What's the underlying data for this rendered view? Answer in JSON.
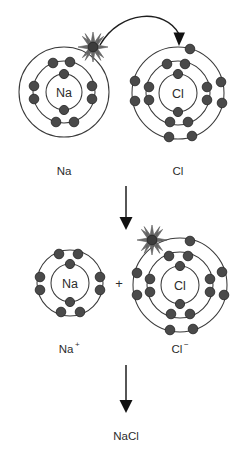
{
  "diagram": {
    "background_color": "#ffffff",
    "stroke_color": "#3a3a3a",
    "electron_color": "#4a4a4a",
    "arrow_color": "#1e1e1e",
    "burst_color": "#6a6a6a"
  },
  "stage_top": {
    "sodium_atom": {
      "symbol": "Na",
      "label": "Na",
      "center": {
        "x": 64,
        "y": 92
      },
      "shells": [
        {
          "index": 1,
          "radius": 18,
          "electron_count": 2
        },
        {
          "index": 2,
          "radius": 31,
          "electron_count": 8
        },
        {
          "index": 3,
          "radius": 45,
          "electron_count": 1
        }
      ],
      "highlighted_electron": {
        "label": "valence-electron",
        "x": 93,
        "y": 47,
        "is_transferring": true
      }
    },
    "chlorine_atom": {
      "symbol": "Cl",
      "label": "Cl",
      "center": {
        "x": 178,
        "y": 93
      },
      "shells": [
        {
          "index": 1,
          "radius": 19,
          "electron_count": 2
        },
        {
          "index": 2,
          "radius": 32,
          "electron_count": 8
        },
        {
          "index": 3,
          "radius": 46,
          "electron_count": 7
        }
      ]
    },
    "transfer_arrow": {
      "label": "electron-transfer-arrow",
      "from": {
        "x": 98,
        "y": 44
      },
      "to": {
        "x": 180,
        "y": 46
      },
      "curved": true
    }
  },
  "stage_middle": {
    "sodium_ion": {
      "symbol": "Na",
      "label": "Na",
      "charge": "+",
      "center": {
        "x": 70,
        "y": 283
      },
      "shells": [
        {
          "index": 1,
          "radius": 19,
          "electron_count": 2
        },
        {
          "index": 2,
          "radius": 33,
          "electron_count": 8
        }
      ]
    },
    "chloride_ion": {
      "symbol": "Cl",
      "label": "Cl",
      "charge": "−",
      "center": {
        "x": 180,
        "y": 285
      },
      "shells": [
        {
          "index": 1,
          "radius": 19,
          "electron_count": 2
        },
        {
          "index": 2,
          "radius": 33,
          "electron_count": 8
        },
        {
          "index": 3,
          "radius": 47,
          "electron_count": 8
        }
      ],
      "gained_electron": {
        "label": "gained-electron",
        "x": 152,
        "y": 240,
        "is_highlighted": true
      }
    },
    "plus_sign": "+"
  },
  "stage_bottom": {
    "product_label": "NaCl"
  },
  "arrows": {
    "step_one": {
      "label": "reaction-arrow-1",
      "x": 126,
      "y_start": 186,
      "y_end": 228
    },
    "step_two": {
      "label": "reaction-arrow-2",
      "x": 126,
      "y_start": 365,
      "y_end": 412
    }
  },
  "labels": {
    "sodium_atom": "Na",
    "chlorine_atom": "Cl",
    "sodium_ion_base": "Na",
    "sodium_ion_charge": "+",
    "chloride_ion_base": "Cl",
    "chloride_ion_charge": "−",
    "product": "NaCl"
  }
}
